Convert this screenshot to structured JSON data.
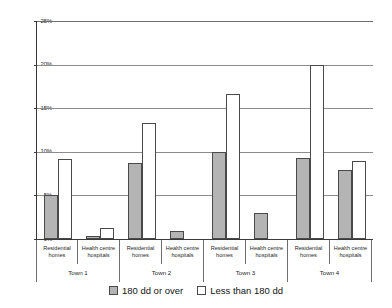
{
  "chart_data": {
    "type": "bar",
    "title": "",
    "subtitle": "",
    "xlabel": "",
    "ylabel": "",
    "ylim": [
      0,
      25
    ],
    "y_tick_labels": [
      "0%",
      "5%",
      "10%",
      "15%",
      "20%",
      "25%"
    ],
    "y_tick_values": [
      0,
      5,
      10,
      15,
      20,
      25
    ],
    "grid": true,
    "legend_position": "bottom",
    "groups": [
      "Town 1",
      "Town 2",
      "Town 3",
      "Town 4"
    ],
    "categories": [
      "Residential homes",
      "Health centre hospitals",
      "Residential homes",
      "Health centre hospitals",
      "Residential homes",
      "Health centre hospitals",
      "Residential homes",
      "Health centre hospitals"
    ],
    "category_lines": [
      [
        "Residential",
        "homes"
      ],
      [
        "Health centre",
        "hospitals"
      ],
      [
        "Residential",
        "homes"
      ],
      [
        "Health centre",
        "hospitals"
      ],
      [
        "Residential",
        "homes"
      ],
      [
        "Health centre",
        "hospitals"
      ],
      [
        "Residential",
        "homes"
      ],
      [
        "Health centre",
        "hospitals"
      ]
    ],
    "series": [
      {
        "name": "180 dd or over",
        "color": "#b4b4b4",
        "values": [
          5.0,
          0.3,
          8.7,
          0.9,
          10.0,
          3.0,
          9.3,
          7.9
        ]
      },
      {
        "name": "Less than 180 dd",
        "color": "#ffffff",
        "values": [
          9.2,
          1.3,
          13.3,
          null,
          16.6,
          null,
          20.0,
          9.0
        ]
      }
    ]
  },
  "legend": {
    "items": [
      {
        "label": "180 dd or over",
        "swatch": "over"
      },
      {
        "label": "Less than 180 dd",
        "swatch": "under"
      }
    ]
  },
  "colors": {
    "bar_over_fill": "#b4b4b4",
    "bar_under_fill": "#ffffff",
    "bar_stroke": "#4a4a4a",
    "gridline": "#8c8c8c",
    "axis": "#3a3a3a",
    "text": "#1a1a1a",
    "background": "#ffffff"
  }
}
